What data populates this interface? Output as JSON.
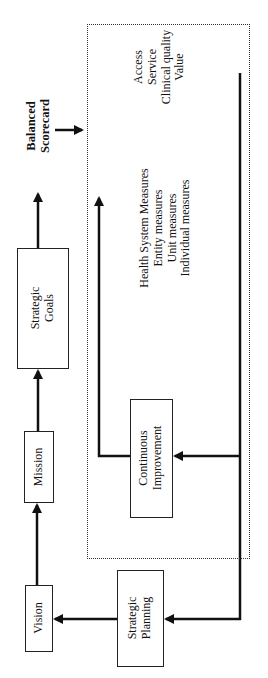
{
  "diagram": {
    "nodes": {
      "vision": {
        "label": "Vision"
      },
      "mission": {
        "label": "Mission"
      },
      "strategic_goals": {
        "lines": [
          "Strategic",
          "Goals"
        ]
      },
      "strategic_planning": {
        "lines": [
          "Strategic",
          "Planning"
        ]
      },
      "continuous_improvement": {
        "lines": [
          "Continuous",
          "Improvement"
        ]
      },
      "balanced_scorecard": {
        "lines": [
          "Balanced",
          "Scorecard"
        ]
      }
    },
    "scorecard_dimensions": [
      "Access",
      "Service",
      "Clinical quality",
      "Value"
    ],
    "measure_levels": [
      "Health System Measures",
      "Entity measures",
      "Unit measures",
      "Individual measures"
    ],
    "edges": [
      {
        "from": "Vision",
        "to": "Mission"
      },
      {
        "from": "Mission",
        "to": "Strategic Goals"
      },
      {
        "from": "Strategic Goals",
        "to": "Balanced Scorecard"
      },
      {
        "from": "Balanced Scorecard",
        "to": "Scorecard box"
      },
      {
        "from": "Scorecard box",
        "to": "Continuous Improvement"
      },
      {
        "from": "Continuous Improvement",
        "to": "Scorecard box (top)"
      },
      {
        "from": "Scorecard box",
        "to": "Strategic Planning"
      },
      {
        "from": "Strategic Planning",
        "to": "Vision"
      }
    ]
  }
}
